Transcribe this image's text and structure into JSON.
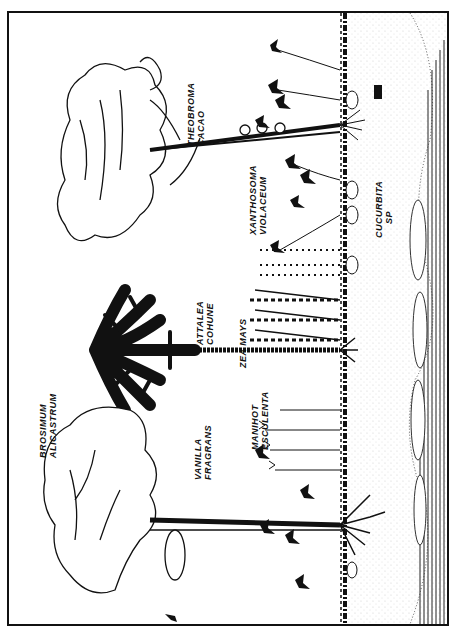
{
  "figure": {
    "orientation": "rotated-90-ccw",
    "colors": {
      "ink": "#111111",
      "paper": "#ffffff",
      "soil_stipple": "#777777"
    },
    "ground_marker": "soil-sample-icon"
  },
  "labels": [
    {
      "id": "brosimum",
      "line1": "BROSIMUM",
      "line2": "ALICASTRUM"
    },
    {
      "id": "vanilla",
      "line1": "VANILLA",
      "line2": "FRAGRANS"
    },
    {
      "id": "attalea",
      "line1": "ATTALEA",
      "line2": "COHUNE"
    },
    {
      "id": "zea",
      "line1": "ZEA MAYS",
      "line2": ""
    },
    {
      "id": "manihot",
      "line1": "MANIHOT",
      "line2": "ESCULENTA"
    },
    {
      "id": "theobroma",
      "line1": "THEOBROMA",
      "line2": "CACAO"
    },
    {
      "id": "xanthosoma",
      "line1": "XANTHOSOMA",
      "line2": "VIOLACEUM"
    },
    {
      "id": "cucurbita",
      "line1": "CUCURBITA",
      "line2": "SP"
    }
  ]
}
